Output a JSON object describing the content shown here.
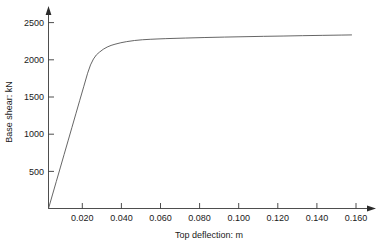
{
  "chart_data": {
    "type": "line",
    "title": "",
    "subtitle": "",
    "xlabel": "Top deflection: m",
    "ylabel": "Base shear: kN",
    "xlim": [
      0.0,
      0.168
    ],
    "ylim": [
      0,
      2650
    ],
    "xticks": [
      0.02,
      0.04,
      0.06,
      0.08,
      0.1,
      0.12,
      0.14,
      0.16
    ],
    "xtick_labels": [
      "0.020",
      "0.040",
      "0.060",
      "0.080",
      "0.100",
      "0.120",
      "0.140",
      "0.160"
    ],
    "yticks": [
      500,
      1000,
      1500,
      2000,
      2500
    ],
    "ytick_labels": [
      "500",
      "1000",
      "1500",
      "2000",
      "2500"
    ],
    "grid": false,
    "legend": null,
    "annotations": [],
    "axis_style": "arrow-tipped axes, ticks outside, no box frame",
    "line_color": "#555555",
    "series": [
      {
        "name": "Pushover curve",
        "x": [
          0.0,
          0.002,
          0.004,
          0.006,
          0.008,
          0.01,
          0.012,
          0.014,
          0.016,
          0.018,
          0.02,
          0.0215,
          0.023,
          0.0245,
          0.026,
          0.028,
          0.03,
          0.032,
          0.034,
          0.037,
          0.04,
          0.044,
          0.048,
          0.052,
          0.056,
          0.06,
          0.07,
          0.08,
          0.09,
          0.1,
          0.11,
          0.12,
          0.13,
          0.14,
          0.15,
          0.155
        ],
        "y": [
          0,
          182,
          364,
          545,
          727,
          909,
          1091,
          1273,
          1455,
          1636,
          1818,
          1930,
          2010,
          2065,
          2100,
          2140,
          2170,
          2192,
          2208,
          2228,
          2243,
          2258,
          2268,
          2274,
          2279,
          2283,
          2291,
          2298,
          2304,
          2309,
          2314,
          2318,
          2323,
          2327,
          2331,
          2333
        ]
      }
    ],
    "description_points": {
      "yield_deflection": 0.022,
      "yield_base_shear": 2000,
      "peak_base_shear": 2333,
      "final_deflection": 0.155
    }
  },
  "axes": {
    "x_axis_name": "top-deflection-axis",
    "y_axis_name": "base-shear-axis"
  }
}
